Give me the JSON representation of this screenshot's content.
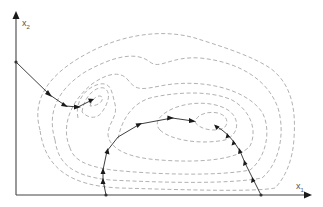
{
  "diagram": {
    "axes": {
      "x_label": "x",
      "x_sub": "1",
      "y_label": "x",
      "y_sub": "2"
    },
    "colors": {
      "contour": "#a8a8a8",
      "path": "#2a2a2a",
      "axis": "#444444"
    },
    "paths": [
      {
        "name": "path-from-left-axis",
        "start": [
          16,
          62
        ],
        "points": [
          [
            16,
            62
          ],
          [
            50,
            95
          ],
          [
            66,
            106
          ],
          [
            78,
            107
          ],
          [
            92,
            100
          ]
        ]
      },
      {
        "name": "path-from-bottom-middle",
        "start": [
          106,
          195
        ],
        "points": [
          [
            106,
            195
          ],
          [
            103,
            180
          ],
          [
            103,
            170
          ],
          [
            107,
            151
          ],
          [
            118,
            137
          ],
          [
            140,
            124
          ],
          [
            172,
            118
          ],
          [
            193,
            121
          ]
        ]
      },
      {
        "name": "path-from-bottom-right",
        "start": [
          261,
          195
        ],
        "points": [
          [
            261,
            195
          ],
          [
            253,
            179
          ],
          [
            245,
            163
          ],
          [
            240,
            151
          ],
          [
            234,
            142
          ],
          [
            228,
            135
          ],
          [
            222,
            130
          ],
          [
            216,
            126
          ]
        ]
      }
    ]
  }
}
